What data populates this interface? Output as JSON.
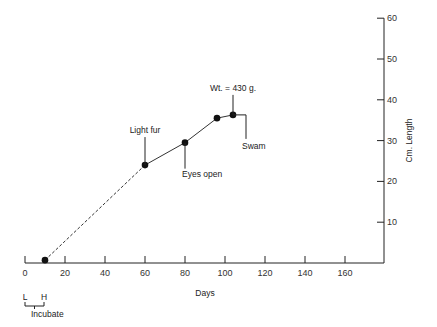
{
  "chart_data": {
    "type": "line",
    "title": "",
    "xlabel": "Days",
    "ylabel": "Cm. Length",
    "xlim": [
      0,
      180
    ],
    "ylim": [
      0,
      60
    ],
    "x_ticks": [
      "0",
      "20",
      "40",
      "60",
      "80",
      "100",
      "120",
      "140",
      "160"
    ],
    "y_ticks": [
      "10",
      "20",
      "30",
      "40",
      "50",
      "60"
    ],
    "y_axis_position": "right",
    "grid": false,
    "legend": null,
    "series": [
      {
        "name": "Length",
        "x": [
          10,
          60,
          80,
          96,
          104
        ],
        "y": [
          0.7,
          24,
          29.5,
          35.5,
          36.3
        ],
        "segments": [
          {
            "from": 0,
            "to": 1,
            "style": "dashed"
          },
          {
            "from": 1,
            "to": 4,
            "style": "solid"
          }
        ]
      }
    ],
    "annotations": [
      {
        "text": "Light fur",
        "x": 60,
        "y": 24
      },
      {
        "text": "Eyes open",
        "x": 80,
        "y": 29.5
      },
      {
        "text": "Wt. = 430 g.",
        "x": 104,
        "y": 36.3
      },
      {
        "text": "Swam",
        "x": 112,
        "y": 36.3
      }
    ],
    "below_axis_labels": {
      "left": "L",
      "right": "H",
      "bracket_label": "Incubate"
    }
  }
}
